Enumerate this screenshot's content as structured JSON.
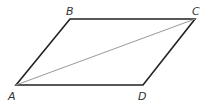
{
  "diagram": {
    "type": "parallelogram",
    "vertices": {
      "A": {
        "label": "A",
        "x": 16,
        "y": 85
      },
      "B": {
        "label": "B",
        "x": 70,
        "y": 19
      },
      "C": {
        "label": "C",
        "x": 195,
        "y": 19
      },
      "D": {
        "label": "D",
        "x": 143,
        "y": 85
      }
    },
    "diagonal": {
      "from": "A",
      "to": "C"
    },
    "colors": {
      "edge": "#222222",
      "diagonal": "#999999",
      "label": "#333333"
    }
  }
}
